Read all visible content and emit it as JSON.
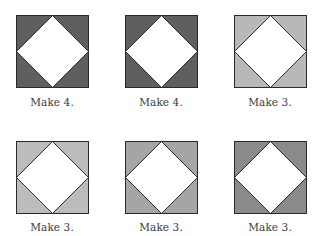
{
  "figure": {
    "blocks": [
      {
        "caption": "Make 4.",
        "corner_color": "#5f5f5f",
        "center_color": "#ffffff"
      },
      {
        "caption": "Make 4.",
        "corner_color": "#5f5f5f",
        "center_color": "#ffffff"
      },
      {
        "caption": "Make 3.",
        "corner_color": "#b8b8b8",
        "center_color": "#ffffff"
      },
      {
        "caption": "Make 3.",
        "corner_color": "#bcbcbc",
        "center_color": "#ffffff"
      },
      {
        "caption": "Make 3.",
        "corner_color": "#a5a5a5",
        "center_color": "#ffffff"
      },
      {
        "caption": "Make 3.",
        "corner_color": "#8a8a8a",
        "center_color": "#ffffff"
      }
    ],
    "outline_color": "#2a2a2a"
  }
}
